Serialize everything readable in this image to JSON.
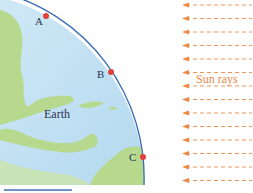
{
  "diagram": {
    "earth_label": "Earth",
    "sun_label": "Sun rays",
    "points": [
      {
        "id": "A",
        "label": "A",
        "x": 46,
        "y": 16
      },
      {
        "id": "B",
        "label": "B",
        "x": 111,
        "y": 72
      },
      {
        "id": "C",
        "label": "C",
        "x": 142,
        "y": 157
      }
    ],
    "ray_count": 14,
    "colors": {
      "ocean": "#bfe0f2",
      "land": "#b6d98e",
      "outline": "#3d6fb5",
      "point": "#e2403a",
      "rays": "#ef8a45"
    }
  }
}
